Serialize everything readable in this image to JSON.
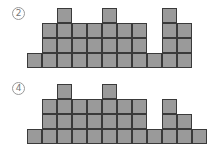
{
  "figures": [
    {
      "label": "2",
      "origin": {
        "x": 27,
        "y": 8
      },
      "cell_size": 15,
      "max_height": 4,
      "column_heights": [
        1,
        3,
        4,
        3,
        3,
        4,
        3,
        3,
        1,
        4,
        3
      ]
    },
    {
      "label": "4",
      "origin": {
        "x": 27,
        "y": 84
      },
      "cell_size": 15,
      "max_height": 4,
      "column_heights": [
        1,
        3,
        4,
        3,
        3,
        4,
        3,
        3,
        1,
        3,
        2,
        1
      ]
    }
  ],
  "colors": {
    "fill": "#9a9a9a",
    "stroke": "#3a3a3a"
  }
}
